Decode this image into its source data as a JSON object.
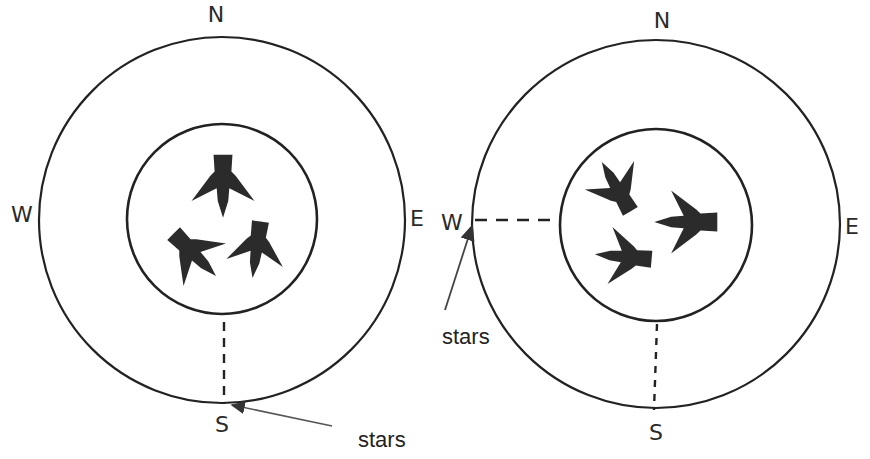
{
  "diagrams": [
    {
      "id": "left",
      "compass": {
        "north": "N",
        "south": "S",
        "west": "W",
        "east": "E"
      },
      "annotation": {
        "label": "stars",
        "points_to": "S"
      },
      "birds": [
        {
          "heading": "south"
        },
        {
          "heading": "south-east"
        },
        {
          "heading": "south"
        }
      ]
    },
    {
      "id": "right",
      "compass": {
        "north": "N",
        "south": "S",
        "west": "W",
        "east": "E"
      },
      "annotation": {
        "label": "stars",
        "points_to": "W"
      },
      "birds": [
        {
          "heading": "north-west"
        },
        {
          "heading": "west"
        },
        {
          "heading": "west"
        }
      ]
    }
  ],
  "colors": {
    "ink": "#222222",
    "bird": "#2b2b2b",
    "background": "#ffffff"
  }
}
